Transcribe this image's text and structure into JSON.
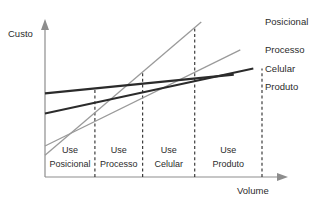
{
  "chart_data": {
    "type": "line",
    "title": "",
    "subtitle": "",
    "xlabel": "Volume",
    "ylabel": "Custo",
    "xlim": [
      0,
      100
    ],
    "ylim": [
      0,
      100
    ],
    "grid": false,
    "legend_position": "line-end-right",
    "axes_style": "arrow-axes-no-ticks",
    "series": [
      {
        "name": "Posicional",
        "color": "#9a9a9a",
        "width": 1.3,
        "x": [
          0,
          72
        ],
        "y": [
          14,
          100
        ],
        "label_x": 100,
        "label_y": 100
      },
      {
        "name": "Processo",
        "color": "#9a9a9a",
        "width": 1.3,
        "x": [
          0,
          90
        ],
        "y": [
          20,
          82
        ],
        "label_x": 100,
        "label_y": 82
      },
      {
        "name": "Celular",
        "color": "#2b2b2b",
        "width": 1.9,
        "x": [
          0,
          96
        ],
        "y": [
          41,
          70
        ],
        "label_x": 100,
        "label_y": 70
      },
      {
        "name": "Produto",
        "color": "#2b2b2b",
        "width": 2.2,
        "x": [
          0,
          87
        ],
        "y": [
          54,
          66
        ],
        "label_x": 100,
        "label_y": 58
      }
    ],
    "dividers": [
      {
        "x": 23,
        "name": "posicional-processo-breakpoint"
      },
      {
        "x": 45,
        "name": "processo-celular-breakpoint"
      },
      {
        "x": 69,
        "name": "celular-produto-breakpoint"
      },
      {
        "x": 100,
        "name": "produto-end-breakpoint"
      }
    ],
    "regions": [
      {
        "line1": "Use",
        "line2": "Posicional",
        "x_start": 0,
        "x_end": 23
      },
      {
        "line1": "Use",
        "line2": "Processo",
        "x_start": 23,
        "x_end": 45
      },
      {
        "line1": "Use",
        "line2": "Celular",
        "x_start": 45,
        "x_end": 69
      },
      {
        "line1": "Use",
        "line2": "Produto",
        "x_start": 69,
        "x_end": 100
      }
    ]
  }
}
